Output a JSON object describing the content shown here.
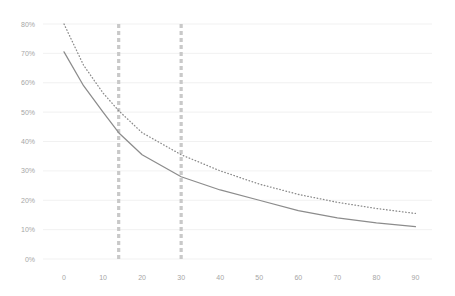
{
  "chart_data": {
    "type": "line",
    "title": "",
    "subtitle": "",
    "xlabel": "",
    "ylabel": "",
    "xlim": [
      0,
      90
    ],
    "ylim": [
      0,
      80
    ],
    "grid": "horizontal",
    "legend": "none",
    "x_tick_labels": [
      "0",
      "10",
      "20",
      "30",
      "40",
      "50",
      "60",
      "70",
      "80",
      "90"
    ],
    "x_ticks": [
      0,
      10,
      20,
      30,
      40,
      50,
      60,
      70,
      80,
      90
    ],
    "y_tick_labels": [
      "0%",
      "10%",
      "20%",
      "30%",
      "40%",
      "50%",
      "60%",
      "70%",
      "80%"
    ],
    "y_ticks": [
      0,
      10,
      20,
      30,
      40,
      50,
      60,
      70,
      80
    ],
    "x": [
      0,
      5,
      10,
      14,
      20,
      30,
      40,
      50,
      60,
      70,
      80,
      90
    ],
    "series": [
      {
        "name": "series-solid",
        "style": "solid",
        "color": "#8c8c8c",
        "values": [
          70.5,
          59.0,
          50.0,
          43.0,
          35.5,
          28.0,
          23.5,
          20.0,
          16.5,
          14.0,
          12.3,
          11.0
        ]
      },
      {
        "name": "series-dotted",
        "style": "dotted",
        "color": "#8c8c8c",
        "values": [
          80.0,
          66.0,
          56.5,
          50.5,
          43.0,
          35.5,
          30.0,
          25.5,
          22.0,
          19.3,
          17.2,
          15.5
        ]
      }
    ],
    "reference_lines": [
      {
        "name": "marker-line-1",
        "axis": "x",
        "value": 14,
        "style": "dashed",
        "color": "#c9c9c9"
      },
      {
        "name": "marker-line-2",
        "axis": "x",
        "value": 30,
        "style": "dashed",
        "color": "#c9c9c9"
      }
    ],
    "colors": {
      "background": "#ffffff",
      "grid": "#ededed",
      "tick_text": "#a6a6a6",
      "line": "#8c8c8c",
      "marker": "#c9c9c9"
    }
  }
}
